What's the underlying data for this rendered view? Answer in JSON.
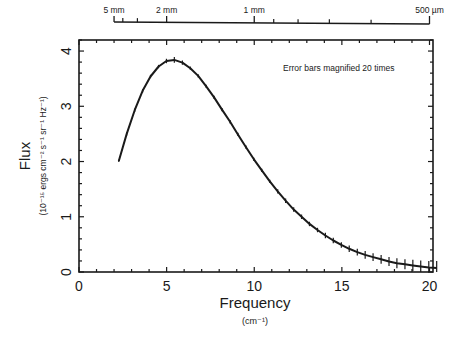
{
  "chart_data": {
    "type": "line",
    "title": "",
    "annotation": "Error bars magnified 20 times",
    "xlabel": "Frequency",
    "xlabel_units": "(cm⁻¹)",
    "ylabel": "Flux",
    "ylabel_units": "(10⁻¹⁵ ergs cm⁻² s⁻¹ sr⁻¹ Hz⁻¹)",
    "xlim": [
      0,
      20.2
    ],
    "ylim": [
      0,
      4.2
    ],
    "x_ticks": [
      0,
      5,
      10,
      15,
      20
    ],
    "x_tick_labels": [
      "0",
      "5",
      "10",
      "15",
      "20"
    ],
    "y_ticks": [
      0,
      1,
      2,
      3,
      4
    ],
    "y_tick_labels": [
      "0",
      "1",
      "2",
      "3",
      "4"
    ],
    "top_axis": {
      "label_positions_cm": [
        2.0,
        5.0,
        10.0,
        20.0
      ],
      "labels": [
        "5 mm",
        "2 mm",
        "1 mm",
        "500 µm"
      ],
      "minor_positions_cm": [
        2.5,
        3.333,
        11.111,
        12.5,
        14.286,
        16.667
      ]
    },
    "grid": false,
    "legend": null,
    "series": [
      {
        "name": "Measured spectrum with fit",
        "error_bars": true,
        "x": [
          2.27,
          2.72,
          3.18,
          3.63,
          4.08,
          4.54,
          4.99,
          5.44,
          5.9,
          6.35,
          6.8,
          7.26,
          7.71,
          8.16,
          8.62,
          9.07,
          9.53,
          9.98,
          10.43,
          10.89,
          11.34,
          11.79,
          12.25,
          12.7,
          13.15,
          13.61,
          14.06,
          14.51,
          14.97,
          15.42,
          15.88,
          16.33,
          16.78,
          17.24,
          17.69,
          18.14,
          18.6,
          19.05,
          19.5,
          19.96,
          20.41
        ],
        "y": [
          2.01,
          2.5,
          2.93,
          3.28,
          3.54,
          3.72,
          3.82,
          3.84,
          3.79,
          3.69,
          3.55,
          3.36,
          3.16,
          2.94,
          2.72,
          2.49,
          2.26,
          2.04,
          1.84,
          1.64,
          1.46,
          1.29,
          1.13,
          1.0,
          0.87,
          0.76,
          0.66,
          0.57,
          0.49,
          0.42,
          0.36,
          0.31,
          0.27,
          0.23,
          0.19,
          0.16,
          0.14,
          0.12,
          0.1,
          0.08,
          0.07
        ],
        "err_display": [
          0.02,
          0.03,
          0.03,
          0.03,
          0.03,
          0.03,
          0.04,
          0.05,
          0.04,
          0.03,
          0.03,
          0.03,
          0.03,
          0.03,
          0.03,
          0.03,
          0.03,
          0.03,
          0.03,
          0.03,
          0.04,
          0.04,
          0.04,
          0.04,
          0.04,
          0.04,
          0.05,
          0.05,
          0.05,
          0.06,
          0.06,
          0.07,
          0.07,
          0.08,
          0.08,
          0.09,
          0.09,
          0.1,
          0.11,
          0.12,
          0.13
        ]
      }
    ]
  }
}
